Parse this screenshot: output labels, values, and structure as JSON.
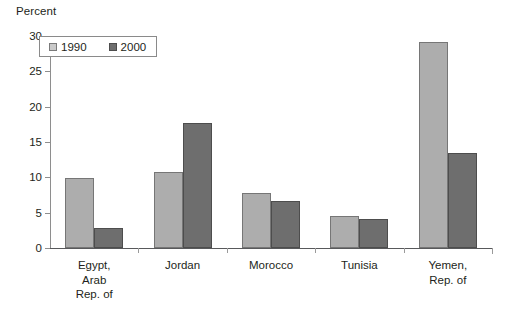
{
  "chart_data": {
    "type": "bar",
    "title": "",
    "subtitle": "",
    "xlabel": "",
    "ylabel": "Percent",
    "ylim": [
      0,
      30
    ],
    "yticks": [
      0,
      5,
      10,
      15,
      20,
      25,
      30
    ],
    "ytick_labels": [
      "0",
      "5",
      "10",
      "15",
      "20",
      "25",
      "30"
    ],
    "grid": false,
    "legend_position": "top-left",
    "categories": [
      "Egypt,\nArab\nRep. of",
      "Jordan",
      "Morocco",
      "Tunisia",
      "Yemen,\nRep. of"
    ],
    "series": [
      {
        "name": "1990",
        "color": "#ADADAD",
        "values": [
          9.9,
          10.7,
          7.8,
          4.6,
          29.1
        ]
      },
      {
        "name": "2000",
        "color": "#6E6E6E",
        "values": [
          2.9,
          17.7,
          6.6,
          4.1,
          13.5
        ]
      }
    ]
  },
  "legend": {
    "entries": [
      {
        "label": "1990"
      },
      {
        "label": "2000"
      }
    ]
  },
  "axis": {
    "y_title": "Percent"
  }
}
